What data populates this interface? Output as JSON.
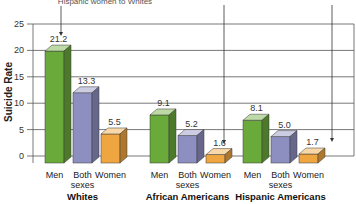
{
  "chart_data": {
    "type": "bar",
    "title": "",
    "annotation_top": "Hispanic women to Whites",
    "xlabel": "",
    "ylabel": "Suicide Rate",
    "ylim": [
      0,
      25
    ],
    "yticks": [
      0,
      5,
      10,
      15,
      20,
      25
    ],
    "grid": true,
    "groups": [
      "Whites",
      "African Americans",
      "Hispanic Americans"
    ],
    "categories": [
      "Men",
      "Both sexes",
      "Women"
    ],
    "series": [
      {
        "name": "Men",
        "color": "#6aaa3a",
        "values": [
          21.2,
          9.1,
          8.1
        ]
      },
      {
        "name": "Both sexes",
        "color": "#8d8fc0",
        "values": [
          13.3,
          5.2,
          5.0
        ]
      },
      {
        "name": "Women",
        "color": "#f0a640",
        "values": [
          5.5,
          1.6,
          1.7
        ]
      }
    ],
    "category_labels": [
      {
        "line1": "Men",
        "line2": ""
      },
      {
        "line1": "Both",
        "line2": "sexes"
      },
      {
        "line1": "Women",
        "line2": ""
      }
    ],
    "legend": "none"
  }
}
